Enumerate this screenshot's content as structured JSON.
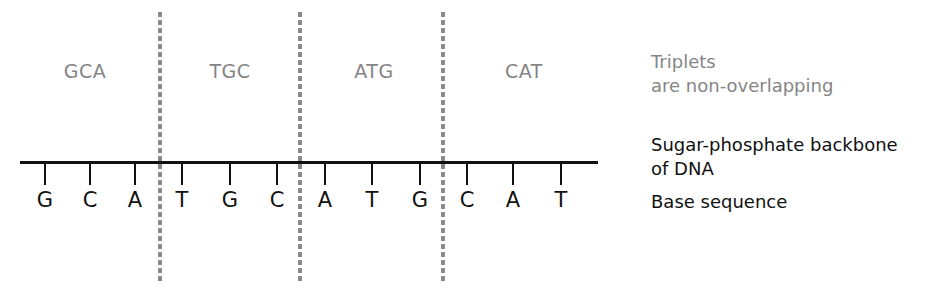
{
  "diagram": {
    "triplets": [
      {
        "label": "GCA",
        "x": 85
      },
      {
        "label": "TGC",
        "x": 230
      },
      {
        "label": "ATG",
        "x": 374
      },
      {
        "label": "CAT",
        "x": 524
      }
    ],
    "bases": [
      {
        "letter": "G",
        "x": 45
      },
      {
        "letter": "C",
        "x": 90
      },
      {
        "letter": "A",
        "x": 135
      },
      {
        "letter": "T",
        "x": 182
      },
      {
        "letter": "G",
        "x": 230
      },
      {
        "letter": "C",
        "x": 277
      },
      {
        "letter": "A",
        "x": 325
      },
      {
        "letter": "T",
        "x": 372
      },
      {
        "letter": "G",
        "x": 420
      },
      {
        "letter": "C",
        "x": 467
      },
      {
        "letter": "A",
        "x": 513
      },
      {
        "letter": "T",
        "x": 561
      }
    ],
    "dividers_x": [
      160,
      300,
      443
    ],
    "colors": {
      "triplet_text": "#858585",
      "divider": "#8a8a8a",
      "backbone": "#111111"
    }
  },
  "legend": {
    "triplets_line1": "Triplets",
    "triplets_line2": "are non-overlapping",
    "backbone_line1": "Sugar-phosphate backbone",
    "backbone_line2": "of DNA",
    "base_sequence": "Base sequence"
  }
}
